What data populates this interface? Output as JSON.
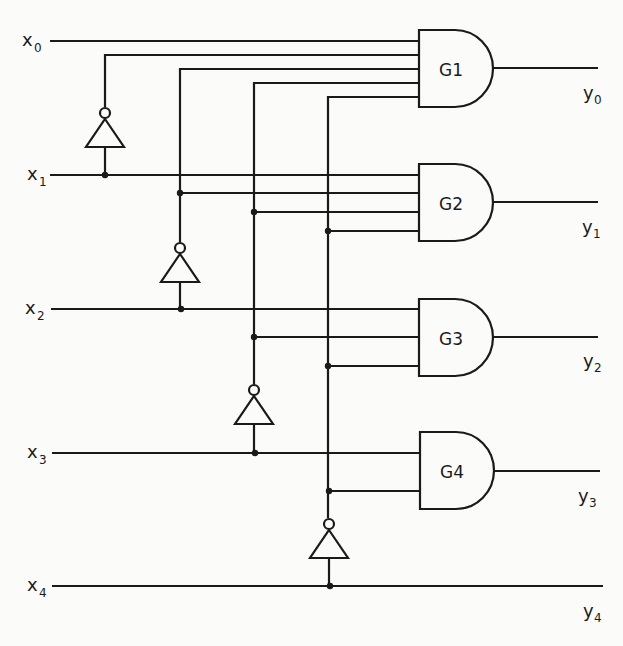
{
  "diagram": {
    "type": "logic-circuit",
    "inputs": [
      {
        "base": "x",
        "sub": "0"
      },
      {
        "base": "x",
        "sub": "1"
      },
      {
        "base": "x",
        "sub": "2"
      },
      {
        "base": "x",
        "sub": "3"
      },
      {
        "base": "x",
        "sub": "4"
      }
    ],
    "outputs": [
      {
        "base": "y",
        "sub": "0"
      },
      {
        "base": "y",
        "sub": "1"
      },
      {
        "base": "y",
        "sub": "2"
      },
      {
        "base": "y",
        "sub": "3"
      },
      {
        "base": "y",
        "sub": "4"
      }
    ],
    "gates": [
      {
        "name": "G1",
        "type": "AND",
        "inputs": [
          "x0",
          "not x0",
          "not x1",
          "not x2",
          "not x3"
        ],
        "output": "y0"
      },
      {
        "name": "G2",
        "type": "AND",
        "inputs": [
          "x1",
          "not x1",
          "not x2",
          "not x3"
        ],
        "output": "y1"
      },
      {
        "name": "G3",
        "type": "AND",
        "inputs": [
          "x2",
          "not x2",
          "not x3"
        ],
        "output": "y2"
      },
      {
        "name": "G4",
        "type": "AND",
        "inputs": [
          "x3",
          "not x3"
        ],
        "output": "y3"
      }
    ],
    "inverters": [
      {
        "input": "x1",
        "output": "not x0"
      },
      {
        "input": "x2",
        "output": "not x1"
      },
      {
        "input": "x3",
        "output": "not x2"
      },
      {
        "input": "x4",
        "output": "not x3"
      }
    ],
    "passthrough": {
      "from": "x4",
      "to": "y4"
    },
    "colors": {
      "ink": "#1a1a1a",
      "background": "#fbfbfa"
    }
  }
}
